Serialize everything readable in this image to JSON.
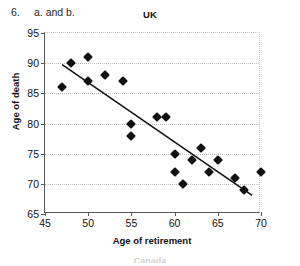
{
  "header": {
    "question_number": "6.",
    "question_text": "a. and b."
  },
  "bleed": {
    "bottom_partial_label": "Canada"
  },
  "chart_data": {
    "type": "scatter",
    "title": "UK",
    "xlabel": "Age of retirement",
    "ylabel": "Age of death",
    "xlim": [
      45,
      70
    ],
    "ylim": [
      65,
      95
    ],
    "xticks": [
      45,
      50,
      55,
      60,
      65,
      70
    ],
    "yticks": [
      65,
      70,
      75,
      80,
      85,
      90,
      95
    ],
    "grid": "horizontal-dotted",
    "legend": "none",
    "marker": "diamond",
    "marker_color": "#111111",
    "points": [
      {
        "x": 47,
        "y": 86
      },
      {
        "x": 48,
        "y": 90
      },
      {
        "x": 50,
        "y": 91
      },
      {
        "x": 50,
        "y": 87
      },
      {
        "x": 52,
        "y": 88
      },
      {
        "x": 54,
        "y": 87
      },
      {
        "x": 55,
        "y": 80
      },
      {
        "x": 55,
        "y": 78
      },
      {
        "x": 58,
        "y": 81
      },
      {
        "x": 59,
        "y": 81
      },
      {
        "x": 60,
        "y": 75
      },
      {
        "x": 60,
        "y": 72
      },
      {
        "x": 61,
        "y": 70
      },
      {
        "x": 62,
        "y": 74
      },
      {
        "x": 63,
        "y": 76
      },
      {
        "x": 64,
        "y": 72
      },
      {
        "x": 65,
        "y": 74
      },
      {
        "x": 67,
        "y": 71
      },
      {
        "x": 68,
        "y": 69
      },
      {
        "x": 70,
        "y": 72
      }
    ],
    "trendline": {
      "type": "linear-fit",
      "color": "#111111",
      "x_start": 47,
      "y_start": 89.7,
      "x_end": 69.2,
      "y_end": 67.8
    }
  }
}
